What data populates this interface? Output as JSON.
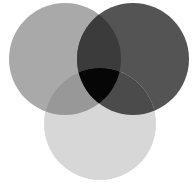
{
  "diagram": {
    "type": "venn",
    "background": "#ffffff",
    "sets": [
      {
        "id": "A",
        "position": "top-left",
        "cx": 65,
        "cy": 59,
        "r": 56,
        "color": "#a9a9a9"
      },
      {
        "id": "B",
        "position": "top-right",
        "cx": 133,
        "cy": 59,
        "r": 56,
        "color": "#545454"
      },
      {
        "id": "C",
        "position": "bottom",
        "cx": 100,
        "cy": 124,
        "r": 56,
        "color": "#d7d7d7"
      }
    ],
    "overlaps": {
      "AB": "#3b3b3b",
      "AC": "#989898",
      "BC": "#4b4b4b",
      "ABC": "#060606"
    },
    "labels": []
  }
}
